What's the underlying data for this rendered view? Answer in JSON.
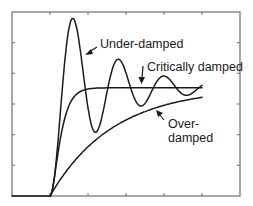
{
  "chart_data": {
    "type": "line",
    "title": "",
    "xlabel": "",
    "ylabel": "",
    "grid": false,
    "legend": "none (inline annotations)",
    "x_range": [
      0,
      6
    ],
    "y_range": [
      0,
      1.7
    ],
    "x_ticks": [
      0,
      1,
      2,
      3,
      4,
      5,
      6
    ],
    "y_ticks": [
      0,
      0.28,
      0.57,
      0.85,
      1.13,
      1.42,
      1.7
    ],
    "tick_labels_shown": false,
    "step_time": 1,
    "series": [
      {
        "name": "Under-damped",
        "description": "Step response oscillating about 1.0 with decaying amplitude",
        "key_points": [
          {
            "t": 1.0,
            "y": 0.0
          },
          {
            "t": 1.6,
            "y": 1.55
          },
          {
            "t": 2.2,
            "y": 0.67
          },
          {
            "t": 2.8,
            "y": 1.18
          },
          {
            "t": 3.4,
            "y": 0.9
          },
          {
            "t": 4.0,
            "y": 1.06
          },
          {
            "t": 4.6,
            "y": 0.97
          },
          {
            "t": 5.0,
            "y": 1.01
          }
        ]
      },
      {
        "name": "Critically damped",
        "description": "Fastest non-oscillating rise to 1.0",
        "key_points": [
          {
            "t": 1.0,
            "y": 0.0
          },
          {
            "t": 1.5,
            "y": 0.75
          },
          {
            "t": 2.0,
            "y": 0.98
          },
          {
            "t": 3.0,
            "y": 1.0
          },
          {
            "t": 5.0,
            "y": 1.0
          }
        ]
      },
      {
        "name": "Over-damped",
        "description": "Slow exponential-like rise approaching 1.0",
        "key_points": [
          {
            "t": 1.0,
            "y": 0.0
          },
          {
            "t": 2.0,
            "y": 0.45
          },
          {
            "t": 3.0,
            "y": 0.68
          },
          {
            "t": 4.0,
            "y": 0.83
          },
          {
            "t": 5.0,
            "y": 0.91
          }
        ]
      }
    ],
    "annotations": [
      {
        "text": "Under-damped",
        "points_to": "Under-damped"
      },
      {
        "text": "Critically damped",
        "points_to": "Critically damped"
      },
      {
        "text": "Over-\ndamped",
        "points_to": "Over-damped"
      }
    ]
  },
  "labels": {
    "underdamped": "Under-damped",
    "critically": "Critically damped",
    "over_line1": "Over-",
    "over_line2": "damped"
  }
}
